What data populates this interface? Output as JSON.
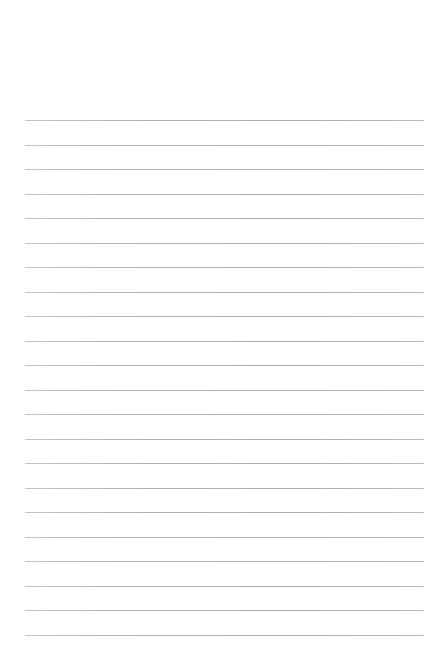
{
  "page": {
    "type": "lined-paper",
    "background_color": "#ffffff",
    "line_color": "#b0b0b0",
    "line_count": 22,
    "first_line_y": 120,
    "line_spacing": 24.52,
    "line_left": 25,
    "line_right": 424,
    "text_content": ""
  }
}
